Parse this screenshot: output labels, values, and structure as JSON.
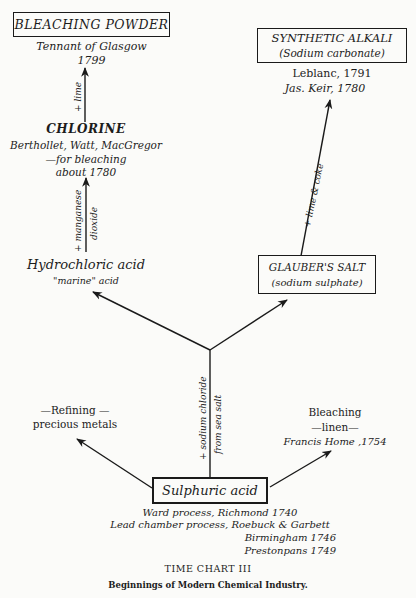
{
  "nodes": {
    "bleaching_powder": {
      "title": "BLEACHING POWDER",
      "details": [
        "Tennant of Glasgow",
        "1799"
      ]
    },
    "chlorine": {
      "title": "CHLORINE",
      "details": [
        "Berthollet, Watt, MacGregor",
        "—for bleaching",
        "about 1780"
      ]
    },
    "hydrochloric_acid": {
      "title": "Hydrochloric acid",
      "subtitle": "\"marine\" acid"
    },
    "synthetic_alkali": {
      "title": "SYNTHETIC ALKALI",
      "subtitle": "(Sodium carbonate)",
      "details": [
        "Leblanc, 1791",
        "Jas. Keir,  1780"
      ]
    },
    "glaubers_salt": {
      "title": "GLAUBER'S SALT",
      "subtitle": "(sodium sulphate)"
    },
    "refining": {
      "lines": [
        "—Refining —",
        "precious metals"
      ]
    },
    "bleaching_linen": {
      "lines": [
        "Bleaching",
        "—linen—",
        "Francis Home ,1754"
      ]
    },
    "sulphuric_acid": {
      "title": "Sulphuric acid",
      "details": [
        "Ward process, Richmond 1740",
        "Lead chamber process, Roebuck & Garbett",
        "Birmingham 1746",
        "Prestonpans 1749"
      ]
    }
  },
  "edges": {
    "lime": "+ lime",
    "manganese_dioxide_1": "+ manganese",
    "manganese_dioxide_2": "dioxide",
    "lime_coke": "+ lime & coke",
    "sodium_chloride_1": "+ sodium chloride",
    "sodium_chloride_2": "from sea salt"
  },
  "caption": {
    "title": "TIME CHART III",
    "subtitle": "Beginnings of Modern Chemical Industry."
  }
}
